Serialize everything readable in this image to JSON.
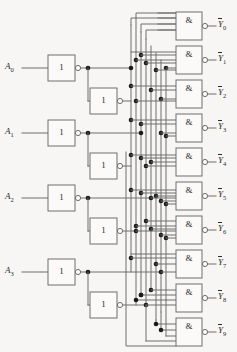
{
  "diagram": {
    "background_color": "#f7f6f4",
    "line_color": "#6f6f6f",
    "dot_color": "#1a1a1a",
    "inputs": [
      {
        "id": "A0",
        "label_letter": "A",
        "label_sub": "0",
        "y": 68
      },
      {
        "id": "A1",
        "label_letter": "A",
        "label_sub": "1",
        "y": 133
      },
      {
        "id": "A2",
        "label_letter": "A",
        "label_sub": "2",
        "y": 198
      },
      {
        "id": "A3",
        "label_letter": "A",
        "label_sub": "3",
        "y": 272
      }
    ],
    "inverters": {
      "symbol": "1",
      "count": 8,
      "first_stage": [
        {
          "name": "inv-a0",
          "x": 48,
          "y": 55
        },
        {
          "name": "inv-a1",
          "x": 48,
          "y": 120
        },
        {
          "name": "inv-a2",
          "x": 48,
          "y": 185
        },
        {
          "name": "inv-a3",
          "x": 48,
          "y": 259
        }
      ],
      "second_stage": [
        {
          "name": "inv-a0-b",
          "x": 90,
          "y": 88
        },
        {
          "name": "inv-a1-b",
          "x": 90,
          "y": 153
        },
        {
          "name": "inv-a2-b",
          "x": 90,
          "y": 218
        },
        {
          "name": "inv-a3-b",
          "x": 90,
          "y": 292
        }
      ]
    },
    "gates": {
      "symbol": "&",
      "type": "nand",
      "inputs_per_gate": 4,
      "count": 10,
      "list": [
        {
          "name": "gate-y0",
          "y": 12,
          "out_letter": "Y",
          "out_sub": "0"
        },
        {
          "name": "gate-y1",
          "y": 46,
          "out_letter": "Y",
          "out_sub": "1"
        },
        {
          "name": "gate-y2",
          "y": 80,
          "out_letter": "Y",
          "out_sub": "2"
        },
        {
          "name": "gate-y3",
          "y": 114,
          "out_letter": "Y",
          "out_sub": "3"
        },
        {
          "name": "gate-y4",
          "y": 148,
          "out_letter": "Y",
          "out_sub": "4"
        },
        {
          "name": "gate-y5",
          "y": 182,
          "out_letter": "Y",
          "out_sub": "5"
        },
        {
          "name": "gate-y6",
          "y": 216,
          "out_letter": "Y",
          "out_sub": "6"
        },
        {
          "name": "gate-y7",
          "y": 250,
          "out_letter": "Y",
          "out_sub": "7"
        },
        {
          "name": "gate-y8",
          "y": 284,
          "out_letter": "Y",
          "out_sub": "8"
        },
        {
          "name": "gate-y9",
          "y": 318,
          "out_letter": "Y",
          "out_sub": "9"
        }
      ]
    },
    "bus": {
      "description": "Eight vertical rails carrying true and complemented input variables",
      "x_positions": [
        131,
        136,
        141,
        146,
        151,
        156,
        161,
        166
      ]
    }
  }
}
